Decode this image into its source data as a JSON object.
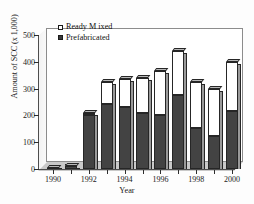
{
  "chart_data": {
    "type": "bar",
    "stacked": true,
    "title": "",
    "xlabel": "Year",
    "ylabel": "Amount of SCC (x 1,000)",
    "categories": [
      "1990",
      "1991",
      "1992",
      "1993",
      "1994",
      "1995",
      "1996",
      "1997",
      "1998",
      "1999",
      "2000"
    ],
    "xtick_labels": [
      "1990",
      "1992",
      "1994",
      "1996",
      "1998",
      "2000"
    ],
    "xtick_categories": [
      "1990",
      "1992",
      "1994",
      "1996",
      "1998",
      "2000"
    ],
    "ylim": [
      0,
      500
    ],
    "ytick_labels": [
      "0",
      "100",
      "200",
      "300",
      "400",
      "500"
    ],
    "ytick_values": [
      0,
      100,
      200,
      300,
      400,
      500
    ],
    "grid": false,
    "legend_position": "top-left",
    "series": [
      {
        "name": "Prefabricated",
        "color": "#434343",
        "swatch": "solid",
        "values": [
          5,
          10,
          200,
          243,
          230,
          210,
          203,
          275,
          152,
          125,
          215
        ]
      },
      {
        "name": "Ready M ixed",
        "color": "#ffffff",
        "swatch": "open",
        "values": [
          0,
          3,
          10,
          82,
          105,
          130,
          162,
          165,
          173,
          173,
          185
        ]
      }
    ],
    "totals": [
      5,
      13,
      210,
      325,
      335,
      340,
      365,
      440,
      325,
      298,
      400
    ]
  },
  "legend": {
    "items": [
      {
        "label": "Ready M ixed",
        "swatch": "open"
      },
      {
        "label": "Prefabricated",
        "swatch": "solid"
      }
    ]
  },
  "axes": {
    "y_title": "Amount of SCC (x 1,000)",
    "x_title": "Year"
  }
}
